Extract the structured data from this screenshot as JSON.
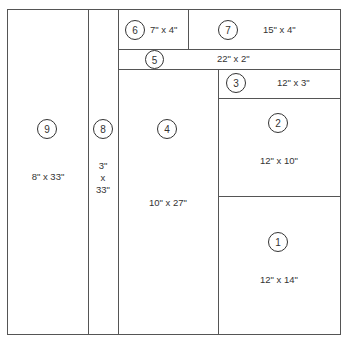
{
  "diagram": {
    "type": "cutting-layout",
    "pieces": [
      {
        "id": "1",
        "dims": "12\" x 14\""
      },
      {
        "id": "2",
        "dims": "12\" x 10\""
      },
      {
        "id": "3",
        "dims": "12\" x 3\""
      },
      {
        "id": "4",
        "dims": "10\" x 27\""
      },
      {
        "id": "5",
        "dims": "22\" x 2\""
      },
      {
        "id": "6",
        "dims": "7\" x 4\""
      },
      {
        "id": "7",
        "dims": "15\" x 4\""
      },
      {
        "id": "8",
        "dims_lines": [
          "3\"",
          "x",
          "33\""
        ]
      },
      {
        "id": "9",
        "dims": "8\" x 33\""
      }
    ]
  }
}
